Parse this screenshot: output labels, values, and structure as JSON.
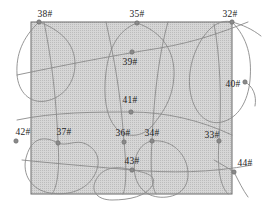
{
  "diagram": {
    "type": "well-pattern-map",
    "title": "",
    "colors": {
      "region_fill": "#d3d3d3",
      "region_stroke": "#5a5a5a",
      "curve_stroke": "#8a8a8a",
      "node_fill": "#8a8a8a",
      "label_color": "#1d1d1d",
      "background": "#ffffff"
    },
    "boundary": {
      "name": "shaded-rectangle",
      "x": 31,
      "y": 22,
      "width": 201,
      "height": 172
    },
    "nodes": [
      {
        "id": "38",
        "label": "38#",
        "px": 39,
        "py": 22,
        "lx": 45,
        "ly": 9
      },
      {
        "id": "35",
        "label": "35#",
        "px": 137,
        "py": 23,
        "lx": 137,
        "ly": 9
      },
      {
        "id": "32",
        "label": "32#",
        "px": 232,
        "py": 22,
        "lx": 230,
        "ly": 9
      },
      {
        "id": "39",
        "label": "39#",
        "px": 132,
        "py": 52,
        "lx": 130,
        "ly": 57
      },
      {
        "id": "40",
        "label": "40#",
        "px": 245,
        "py": 82,
        "lx": 233,
        "ly": 79
      },
      {
        "id": "41",
        "label": "41#",
        "px": 131,
        "py": 112,
        "lx": 130,
        "ly": 95
      },
      {
        "id": "42",
        "label": "42#",
        "px": 16,
        "py": 141,
        "lx": 23,
        "ly": 127
      },
      {
        "id": "37",
        "label": "37#",
        "px": 58,
        "py": 143,
        "lx": 64,
        "ly": 127
      },
      {
        "id": "36",
        "label": "36#",
        "px": 124,
        "py": 142,
        "lx": 123,
        "ly": 128
      },
      {
        "id": "34",
        "label": "34#",
        "px": 152,
        "py": 141,
        "lx": 152,
        "ly": 128
      },
      {
        "id": "33",
        "label": "33#",
        "px": 219,
        "py": 141,
        "lx": 212,
        "ly": 130
      },
      {
        "id": "43",
        "label": "43#",
        "px": 132,
        "py": 170,
        "lx": 132,
        "ly": 156
      },
      {
        "id": "44",
        "label": "44#",
        "px": 234,
        "py": 172,
        "lx": 245,
        "ly": 158
      }
    ],
    "curves": [
      {
        "name": "cell-38-boundary",
        "d": "M 39 22 C 61 30 75 44 75 64 C 75 84 62 98 46 101 C 30 104 18 92 17 74 C 16 55 22 38 39 22 Z"
      },
      {
        "name": "cell-35-boundary",
        "d": "M 137 23 C 163 32 175 52 174 76 C 173 100 161 115 152 126 C 143 137 126 139 116 128 C 106 117 103 96 106 72 C 109 48 118 30 137 23 Z"
      },
      {
        "name": "cell-32-boundary",
        "d": "M 232 22 C 248 38 252 58 250 80 C 248 102 238 118 222 122 C 206 126 193 112 190 90 C 187 68 196 42 211 28 C 218 22 226 20 232 22 Z"
      },
      {
        "name": "cell-37-boundary",
        "d": "M 58 143 C 40 133 30 142 26 158 C 22 174 31 190 50 193 C 69 196 86 190 94 176 C 102 162 98 150 86 144 C 76 139 66 147 58 143 Z"
      },
      {
        "name": "cell-43-boundary",
        "d": "M 132 170 C 112 164 100 170 95 182 C 91 192 98 200 112 200 C 130 200 146 196 152 186 C 157 177 150 173 132 170 Z"
      },
      {
        "name": "cell-34-boundary",
        "d": "M 152 141 C 169 139 183 150 187 166 C 191 183 183 195 167 197 C 150 199 138 190 135 175 C 132 159 139 143 152 141 Z"
      },
      {
        "name": "diagonal-curve-upper",
        "d": "M 17 75 C 60 66 110 56 160 48 C 195 42 220 33 248 22"
      },
      {
        "name": "diagonal-curve-middle",
        "d": "M 17 120 C 55 112 95 112 131 112 C 165 112 200 120 232 135"
      },
      {
        "name": "diagonal-curve-lower",
        "d": "M 22 160 C 60 164 98 167 132 170 C 170 173 210 173 252 165"
      },
      {
        "name": "vertical-curve-left",
        "d": "M 44 22 C 50 52 56 90 58 143 C 60 170 57 188 52 194"
      },
      {
        "name": "vertical-curve-mid-left",
        "d": "M 106 22 C 112 50 120 84 124 142 C 127 170 126 188 123 194"
      },
      {
        "name": "vertical-curve-mid-right",
        "d": "M 168 22 C 160 50 154 92 152 141 C 150 170 152 188 156 194"
      },
      {
        "name": "vertical-curve-right",
        "d": "M 214 24 C 220 55 222 100 219 141 C 217 168 220 186 228 194"
      },
      {
        "name": "tail-32-right",
        "d": "M 232 22 C 243 25 252 29 261 36"
      },
      {
        "name": "tail-44-right",
        "d": "M 234 172 C 239 182 243 190 248 197"
      },
      {
        "name": "tail-44-left",
        "d": "M 234 172 C 228 168 221 164 214 160"
      },
      {
        "name": "arc-40-right",
        "d": "M 245 82 C 253 86 257 96 255 106"
      }
    ]
  }
}
